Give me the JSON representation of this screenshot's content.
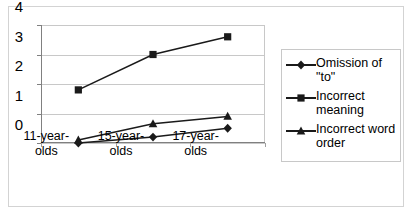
{
  "chart_data": {
    "type": "line",
    "title": "",
    "xlabel": "",
    "ylabel": "",
    "categories": [
      "11-year-olds",
      "15-year-olds",
      "17-year-olds"
    ],
    "ylim": [
      0,
      4
    ],
    "yticks": [
      0,
      1,
      2,
      3,
      4
    ],
    "ytick_labels": [
      "0",
      "1",
      "2",
      "3",
      "4"
    ],
    "grid": true,
    "legend_position": "right",
    "series": [
      {
        "name": "Omission of \"to\"",
        "marker": "diamond",
        "values": [
          0.0,
          0.2,
          0.5
        ]
      },
      {
        "name": "Incorrect meaning",
        "marker": "square",
        "values": [
          1.8,
          3.0,
          3.6
        ]
      },
      {
        "name": "Incorrect word order",
        "marker": "triangle",
        "values": [
          0.1,
          0.65,
          0.9
        ]
      }
    ]
  },
  "legend": {
    "items": [
      {
        "label": "Omission of \"to\"",
        "marker": "diamond-marker-icon"
      },
      {
        "label": "Incorrect meaning",
        "marker": "square-marker-icon"
      },
      {
        "label": "Incorrect word order",
        "marker": "triangle-marker-icon"
      }
    ]
  },
  "colors": {
    "series_line": "#1a1a1a",
    "gridline": "#c8c8c8",
    "axis": "#808080",
    "frame_border": "#d3d3d3",
    "background": "#ffffff"
  }
}
